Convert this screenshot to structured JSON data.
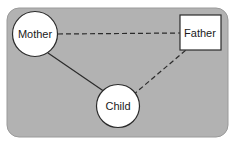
{
  "diagram": {
    "panel": {
      "name": "background-panel",
      "fill": "#b2b2b2",
      "stroke": "#9a9a9a",
      "x": 7,
      "y": 8,
      "width": 221,
      "height": 129,
      "rx": 12
    },
    "nodes": [
      {
        "id": "mother",
        "label": "Mother",
        "shape": "circle",
        "cx": 35,
        "cy": 34,
        "r": 22.5,
        "fill": "#ffffff",
        "stroke": "#2b2b2b"
      },
      {
        "id": "child",
        "label": "Child",
        "shape": "circle",
        "cx": 118,
        "cy": 106,
        "r": 21.5,
        "fill": "#ffffff",
        "stroke": "#2b2b2b"
      },
      {
        "id": "father",
        "label": "Father",
        "shape": "rect",
        "cx": 200,
        "cy": 33,
        "x": 180,
        "y": 15,
        "width": 41,
        "height": 35,
        "fill": "#ffffff",
        "stroke": "#2b2b2b"
      }
    ],
    "edges": [
      {
        "id": "mother-father",
        "from": "mother",
        "to": "father",
        "style": "dashed",
        "stroke": "#2b2b2b",
        "x1": 58,
        "y1": 34,
        "x2": 180,
        "y2": 33
      },
      {
        "id": "mother-child",
        "from": "mother",
        "to": "child",
        "style": "solid",
        "stroke": "#2b2b2b",
        "x1": 48,
        "y1": 53,
        "x2": 105,
        "y2": 92
      },
      {
        "id": "child-father",
        "from": "child",
        "to": "father",
        "style": "dashed",
        "stroke": "#2b2b2b",
        "x1": 133,
        "y1": 95,
        "x2": 186,
        "y2": 50
      }
    ]
  }
}
